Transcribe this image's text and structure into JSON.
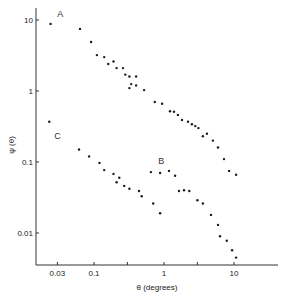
{
  "chart_data": {
    "type": "scatter",
    "title": "",
    "xlabel": "θ  (degrees)",
    "ylabel": "ψ (θ)",
    "xscale": "log",
    "yscale": "log",
    "xlim": [
      0.015,
      25
    ],
    "ylim": [
      0.0035,
      13
    ],
    "grid": false,
    "legend": "inline labels",
    "x_ticks": [
      0.03,
      0.1,
      0.3,
      1,
      3,
      10
    ],
    "x_tick_labels": [
      "0.03",
      "0.1",
      "",
      "1",
      "",
      "10"
    ],
    "y_ticks": [
      10,
      1,
      0.1,
      0.01
    ],
    "y_tick_labels": [
      "10",
      "1",
      "0.1",
      "0.01"
    ],
    "series": [
      {
        "name": "A",
        "label_pos": {
          "x": 0.033,
          "y": 11
        },
        "x": [
          0.024,
          0.063,
          0.091,
          0.11,
          0.14,
          0.16,
          0.19,
          0.21,
          0.26,
          0.28,
          0.32,
          0.32,
          0.34,
          0.4,
          0.4,
          0.52,
          0.74,
          0.94,
          1.22,
          1.39,
          1.58,
          1.81,
          2.2,
          2.5,
          2.8,
          3.1,
          3.6,
          4.1,
          5.0,
          5.9,
          7.2,
          8.5,
          10.7
        ],
        "values": [
          8.8,
          7.5,
          4.9,
          3.2,
          3.0,
          2.4,
          2.6,
          2.1,
          2.1,
          1.7,
          1.6,
          1.1,
          1.25,
          1.6,
          1.2,
          1.03,
          0.7,
          0.66,
          0.52,
          0.51,
          0.46,
          0.39,
          0.37,
          0.34,
          0.32,
          0.3,
          0.23,
          0.25,
          0.2,
          0.16,
          0.11,
          0.075,
          0.066
        ]
      },
      {
        "name": "B",
        "label_pos": {
          "x": 0.91,
          "y": 0.095
        },
        "x": [
          0.65,
          0.88,
          1.18,
          1.44,
          1.64,
          1.93,
          2.3,
          3.0,
          3.6,
          4.7,
          5.9,
          6.3,
          7.9,
          9.4,
          10.7
        ],
        "values": [
          0.072,
          0.07,
          0.075,
          0.064,
          0.039,
          0.04,
          0.039,
          0.029,
          0.026,
          0.018,
          0.013,
          0.009,
          0.0078,
          0.0057,
          0.0045
        ]
      },
      {
        "name": "C",
        "label_pos": {
          "x": 0.03,
          "y": 0.21
        },
        "x": [
          0.023,
          0.061,
          0.085,
          0.12,
          0.14,
          0.19,
          0.21,
          0.23,
          0.27,
          0.32,
          0.44,
          0.48,
          0.7,
          0.88
        ],
        "values": [
          0.37,
          0.15,
          0.12,
          0.097,
          0.077,
          0.068,
          0.052,
          0.06,
          0.046,
          0.042,
          0.039,
          0.033,
          0.026,
          0.019
        ]
      }
    ]
  },
  "layout_map": {
    "x_origin_px": 164,
    "x_decade_px": 70,
    "y_origin_px": 91,
    "y_decade_px": 71,
    "axis_left_px": 36,
    "axis_bottom_px": 265,
    "axis_right_px": 278,
    "axis_top_px": 8
  }
}
